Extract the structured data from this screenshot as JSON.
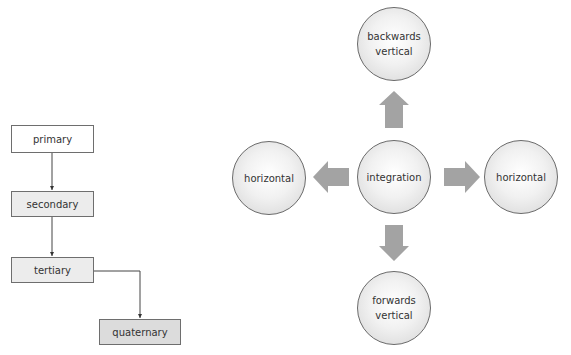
{
  "hierarchy_diagram": {
    "nodes": [
      {
        "id": "primary",
        "label": "primary"
      },
      {
        "id": "secondary",
        "label": "secondary"
      },
      {
        "id": "tertiary",
        "label": "tertiary"
      },
      {
        "id": "quaternary",
        "label": "quaternary"
      }
    ],
    "edges": [
      {
        "from": "primary",
        "to": "secondary"
      },
      {
        "from": "secondary",
        "to": "tertiary"
      },
      {
        "from": "tertiary",
        "to": "quaternary"
      }
    ]
  },
  "integration_diagram": {
    "center": {
      "label": "integration"
    },
    "top": {
      "line1": "backwards",
      "line2": "vertical"
    },
    "bottom": {
      "line1": "forwards",
      "line2": "vertical"
    },
    "left": {
      "label": "horizontal"
    },
    "right": {
      "label": "horizontal"
    },
    "arrow_color": "#a3a3a3"
  },
  "colors": {
    "border": "#6e6e6e",
    "box_fill_light": "#ececec",
    "box_fill_dark": "#dcdcdc",
    "arrow": "#a3a3a3"
  }
}
